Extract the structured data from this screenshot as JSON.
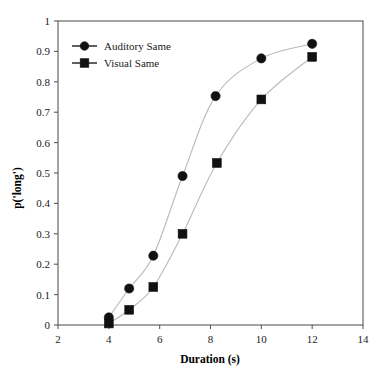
{
  "figure": {
    "background_color": "#ffffff",
    "frame_color": "#5a5a5a",
    "line_color": "#b9b9b9",
    "marker_color": "#111111"
  },
  "chart_data": {
    "type": "line",
    "title": "",
    "xlabel": "Duration (s)",
    "ylabel": "p('long')",
    "xlim": [
      2,
      14
    ],
    "ylim": [
      0,
      1
    ],
    "xticks": [
      2,
      4,
      6,
      8,
      10,
      12,
      14
    ],
    "xtick_labels": [
      "2",
      "4",
      "6",
      "8",
      "10",
      "12",
      "14"
    ],
    "yticks": [
      0,
      0.1,
      0.2,
      0.3,
      0.4,
      0.5,
      0.6,
      0.7,
      0.8,
      0.9,
      1
    ],
    "ytick_labels": [
      "0",
      "0.1",
      "0.2",
      "0.3",
      "0.4",
      "0.5",
      "0.6",
      "0.7",
      "0.8",
      "0.9",
      "1"
    ],
    "grid": false,
    "legend_position": "upper left",
    "series": [
      {
        "name": "Auditory Same",
        "marker": "circle",
        "x": [
          4,
          4.8,
          5.75,
          6.9,
          8.2,
          10,
          12
        ],
        "values": [
          0.025,
          0.12,
          0.228,
          0.49,
          0.753,
          0.877,
          0.925
        ]
      },
      {
        "name": "Visual Same",
        "marker": "square",
        "x": [
          4,
          4.8,
          5.75,
          6.9,
          8.25,
          10,
          12
        ],
        "values": [
          0.005,
          0.05,
          0.125,
          0.3,
          0.533,
          0.742,
          0.882
        ]
      }
    ]
  }
}
